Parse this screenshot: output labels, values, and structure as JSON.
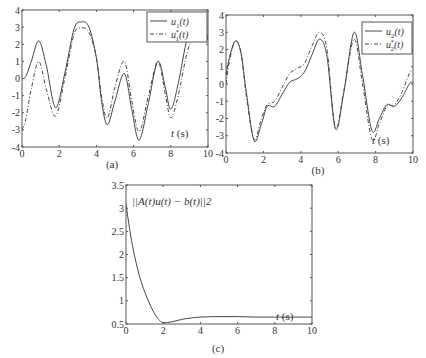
{
  "chart_data": [
    {
      "type": "line",
      "panel": "(a)",
      "caption": "(a)",
      "xlabel": "t (s)",
      "xlabel_var": "t",
      "xlabel_unit": " (s)",
      "xlim": [
        0,
        10
      ],
      "ylim": [
        -4,
        4
      ],
      "xticks": [
        0,
        2,
        4,
        6,
        8,
        10
      ],
      "yticks": [
        -4,
        -3,
        -2,
        -1,
        0,
        1,
        2,
        3,
        4
      ],
      "legend_position": "upper right",
      "series": [
        {
          "name": "u1(t)",
          "legend_base": "u",
          "legend_sub": "1",
          "legend_sup": "",
          "style": "solid",
          "x": [
            0,
            0.2,
            0.5,
            0.9,
            1.3,
            1.8,
            2.3,
            2.8,
            3.2,
            3.6,
            4.0,
            4.3,
            4.6,
            5.0,
            5.5,
            5.9,
            6.3,
            6.8,
            7.3,
            7.7,
            8.0,
            8.4,
            8.9,
            9.4,
            9.8,
            10
          ],
          "y": [
            0.0,
            0.1,
            1.0,
            2.2,
            0.8,
            -1.7,
            0.3,
            2.9,
            3.3,
            3.0,
            1.2,
            -1.5,
            -2.7,
            -1.3,
            0.3,
            -1.8,
            -3.6,
            -1.4,
            1.0,
            -0.5,
            -1.8,
            -0.3,
            2.4,
            3.35,
            3.0,
            2.3
          ]
        },
        {
          "name": "u1*(t)",
          "legend_base": "u",
          "legend_sub": "1",
          "legend_sup": "*",
          "style": "dashed",
          "x": [
            0,
            0.2,
            0.5,
            0.9,
            1.3,
            1.8,
            2.3,
            2.8,
            3.2,
            3.6,
            4.0,
            4.3,
            4.6,
            5.0,
            5.5,
            5.9,
            6.3,
            6.8,
            7.3,
            7.7,
            8.0,
            8.4,
            8.9,
            9.4,
            9.8,
            10
          ],
          "y": [
            -3.0,
            -2.4,
            -0.6,
            1.0,
            -0.6,
            -2.2,
            0.0,
            2.6,
            2.95,
            2.7,
            1.2,
            -1.2,
            -2.3,
            -0.5,
            1.0,
            -1.3,
            -3.1,
            -1.0,
            1.0,
            -0.9,
            -2.3,
            -1.0,
            1.6,
            2.8,
            2.8,
            2.2
          ]
        }
      ]
    },
    {
      "type": "line",
      "panel": "(b)",
      "caption": "(b)",
      "xlabel": "t (s)",
      "xlabel_var": "t",
      "xlabel_unit": " (s)",
      "xlim": [
        0,
        10
      ],
      "ylim": [
        -4,
        4
      ],
      "xticks": [
        0,
        2,
        4,
        6,
        8,
        10
      ],
      "yticks": [
        -4,
        -3,
        -2,
        -1,
        0,
        1,
        2,
        3,
        4
      ],
      "legend_position": "upper right",
      "series": [
        {
          "name": "u2(t)",
          "legend_base": "u",
          "legend_sub": "2",
          "legend_sup": "",
          "style": "solid",
          "x": [
            0,
            0.2,
            0.5,
            0.8,
            1.1,
            1.5,
            1.9,
            2.2,
            2.6,
            3.0,
            3.4,
            3.8,
            4.2,
            4.6,
            5.0,
            5.4,
            5.85,
            6.3,
            6.85,
            7.3,
            7.8,
            8.2,
            8.6,
            9.0,
            9.4,
            9.8,
            10
          ],
          "y": [
            0.5,
            1.6,
            2.5,
            1.8,
            -0.6,
            -3.3,
            -2.3,
            -1.3,
            -1.3,
            -0.6,
            0.1,
            0.3,
            0.7,
            1.7,
            2.6,
            1.6,
            -2.6,
            -0.5,
            3.0,
            0.5,
            -2.7,
            -2.0,
            -1.2,
            -1.3,
            -0.8,
            0.0,
            0.1
          ]
        },
        {
          "name": "u2*(t)",
          "legend_base": "u",
          "legend_sub": "2",
          "legend_sup": "*",
          "style": "dashed",
          "x": [
            0,
            0.2,
            0.5,
            0.8,
            1.1,
            1.5,
            1.9,
            2.2,
            2.6,
            3.0,
            3.4,
            3.8,
            4.2,
            4.6,
            5.0,
            5.4,
            5.85,
            6.3,
            6.85,
            7.3,
            7.8,
            8.2,
            8.6,
            9.0,
            9.4,
            9.8,
            10
          ],
          "y": [
            0.0,
            1.4,
            2.5,
            1.8,
            -0.8,
            -3.2,
            -2.0,
            -1.2,
            -1.0,
            -0.2,
            0.6,
            0.9,
            1.2,
            2.2,
            3.0,
            2.0,
            -2.5,
            -0.4,
            2.6,
            0.0,
            -3.2,
            -2.3,
            -1.3,
            -1.2,
            -0.5,
            0.6,
            0.8
          ]
        }
      ]
    },
    {
      "type": "line",
      "panel": "(c)",
      "caption": "(c)",
      "xlabel": "t (s)",
      "xlabel_var": "t",
      "xlabel_unit": " (s)",
      "xlim": [
        0,
        10
      ],
      "ylim": [
        0.5,
        3.5
      ],
      "xticks": [
        0,
        2,
        4,
        6,
        8,
        10
      ],
      "yticks": [
        0.5,
        1,
        1.5,
        2,
        2.5,
        3,
        3.5
      ],
      "ytick_labels": [
        "0.5",
        "1",
        "1.5",
        "2",
        "2.5",
        "3",
        "3.5"
      ],
      "annotation": "||A(t)u(t) − b(t)||2",
      "series": [
        {
          "name": "||A(t)u(t) - b(t)||_2",
          "style": "solid",
          "x": [
            0,
            0.1,
            0.3,
            0.5,
            0.75,
            1.0,
            1.25,
            1.5,
            1.75,
            2.0,
            2.5,
            3.0,
            3.5,
            4.0,
            5.0,
            6.0,
            7.0,
            8.0,
            9.0,
            10
          ],
          "y": [
            3.1,
            2.8,
            2.3,
            1.9,
            1.5,
            1.2,
            0.95,
            0.75,
            0.6,
            0.53,
            0.55,
            0.6,
            0.63,
            0.65,
            0.66,
            0.66,
            0.65,
            0.65,
            0.65,
            0.65
          ]
        }
      ]
    }
  ]
}
